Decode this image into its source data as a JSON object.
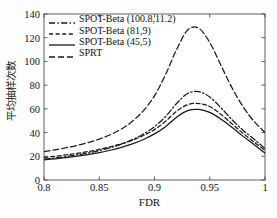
{
  "chart_data": {
    "type": "line",
    "title": "",
    "xlabel": "FDR",
    "ylabel": "平均抽样次数",
    "xlim": [
      0.8,
      1.0
    ],
    "ylim": [
      0,
      140
    ],
    "xticks": [
      "0.8",
      "0.85",
      "0.9",
      "0.95",
      "1"
    ],
    "xtick_values": [
      0.8,
      0.85,
      0.9,
      0.95,
      1.0
    ],
    "yticks": [
      "0",
      "20",
      "40",
      "60",
      "80",
      "100",
      "120",
      "140"
    ],
    "ytick_values": [
      0,
      20,
      40,
      60,
      80,
      100,
      120,
      140
    ],
    "grid": false,
    "legend_position": "top-left",
    "x": [
      0.8,
      0.81,
      0.82,
      0.83,
      0.84,
      0.85,
      0.86,
      0.87,
      0.88,
      0.89,
      0.9,
      0.91,
      0.92,
      0.93,
      0.94,
      0.95,
      0.96,
      0.97,
      0.98,
      0.99,
      1.0
    ],
    "series": [
      {
        "name": "SPRT",
        "style": "dashed",
        "values": [
          24.0,
          25.5,
          27.2,
          29.2,
          31.6,
          34.5,
          38.2,
          43.0,
          49.5,
          58.5,
          71.0,
          89.0,
          110.0,
          126.5,
          128.0,
          116.0,
          97.0,
          78.0,
          62.0,
          49.5,
          40.0
        ]
      },
      {
        "name": "SPOT-Beta (100.8,11.2)",
        "style": "dash-dot",
        "values": [
          17.5,
          18.5,
          19.8,
          21.2,
          22.8,
          24.8,
          27.2,
          30.2,
          34.0,
          38.8,
          45.0,
          53.5,
          64.5,
          73.0,
          74.5,
          70.0,
          61.0,
          51.0,
          42.0,
          34.5,
          26.5
        ]
      },
      {
        "name": "SPOT-Beta (81,9)",
        "style": "short-dashed",
        "values": [
          19.0,
          20.0,
          21.2,
          22.5,
          24.0,
          25.8,
          28.0,
          30.5,
          33.5,
          37.5,
          42.5,
          49.5,
          58.0,
          63.5,
          64.5,
          62.0,
          55.5,
          47.5,
          39.5,
          32.0,
          25.0
        ]
      },
      {
        "name": "SPOT-Beta (45,5)",
        "style": "solid",
        "values": [
          17.0,
          17.9,
          18.9,
          20.1,
          21.5,
          23.1,
          25.1,
          27.5,
          30.4,
          34.2,
          38.9,
          45.0,
          53.0,
          58.5,
          59.5,
          57.0,
          51.5,
          44.5,
          37.0,
          30.0,
          22.5
        ]
      }
    ]
  },
  "legend": {
    "items": [
      {
        "label": "SPOT-Beta (100.8,11.2)",
        "style": "dash-dot"
      },
      {
        "label": "SPOT-Beta (81,9)",
        "style": "short-dashed"
      },
      {
        "label": "SPOT-Beta (45,5)",
        "style": "solid"
      },
      {
        "label": "SPRT",
        "style": "dashed"
      }
    ]
  },
  "colors": {
    "line": "#1a1a1a",
    "axis": "#4d4d4d",
    "background": "#fdfdfd",
    "text": "#141414"
  }
}
